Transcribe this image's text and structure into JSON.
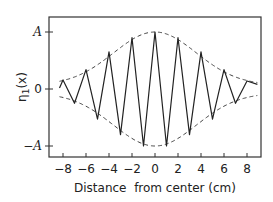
{
  "chart_data": {
    "type": "line",
    "title": "",
    "xlabel": "Distance  from center (cm)",
    "ylabel": "η1(x)",
    "xlim": [
      -8.5,
      9.3
    ],
    "ylim": [
      -1.1,
      1.25
    ],
    "x_ticks": [
      -8,
      -6,
      -4,
      -2,
      0,
      2,
      4,
      6,
      8
    ],
    "x_tick_labels": [
      "-8",
      "-6",
      "-4",
      "-2",
      "0",
      "2",
      "4",
      "6",
      "8"
    ],
    "y_ticks": [
      1,
      0,
      -1
    ],
    "y_tick_labels": [
      "A",
      "0",
      "-A"
    ],
    "grid": false,
    "legend": null,
    "series": [
      {
        "name": "η1(x) oscillation",
        "style": "solid",
        "x": [
          -8.3,
          -8,
          -7,
          -6,
          -5,
          -4,
          -3,
          -2,
          -1,
          0,
          1,
          2,
          3,
          4,
          5,
          6,
          7,
          8,
          8.9
        ],
        "values": [
          0.02,
          0.16,
          -0.25,
          0.34,
          -0.53,
          0.65,
          -0.8,
          0.9,
          -1.0,
          1.0,
          -1.0,
          0.9,
          -0.8,
          0.65,
          -0.53,
          0.34,
          -0.25,
          0.14,
          0.08
        ]
      },
      {
        "name": "upper envelope",
        "style": "dashed",
        "x": [
          -8.3,
          -6,
          -4,
          -2,
          0,
          2,
          4,
          6,
          8,
          8.9
        ],
        "values": [
          0.08,
          0.32,
          0.62,
          0.9,
          1.0,
          0.9,
          0.62,
          0.32,
          0.16,
          0.08
        ]
      },
      {
        "name": "lower envelope",
        "style": "dashed",
        "x": [
          -8.3,
          -6,
          -4,
          -2,
          0,
          2,
          4,
          6,
          8,
          8.9
        ],
        "values": [
          -0.08,
          -0.32,
          -0.62,
          -0.9,
          -1.0,
          -0.9,
          -0.62,
          -0.32,
          -0.16,
          -0.08
        ]
      }
    ]
  }
}
